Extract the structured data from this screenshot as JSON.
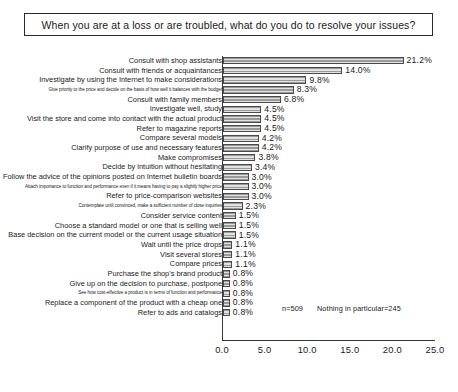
{
  "title": "When you are at a loss or are troubled, what do you do to resolve your issues?",
  "annotation": {
    "sample_size": "n=509",
    "nothing_in_particular": "Nothing in particular=245"
  },
  "chart_data": {
    "type": "bar",
    "orientation": "horizontal",
    "title": "When you are at a loss or are troubled, what do you do to resolve your issues?",
    "xlabel": "",
    "ylabel": "",
    "xlim": [
      0.0,
      25.0
    ],
    "xticks": [
      "0.0",
      "5.0",
      "10.0",
      "15.0",
      "20.0",
      "25.0"
    ],
    "xtick_values": [
      0.0,
      5.0,
      10.0,
      15.0,
      20.0,
      25.0
    ],
    "unit": "%",
    "grid": false,
    "legend": null,
    "categories": [
      "Consult with shop assistants",
      "Consult with friends or acquaintances",
      "Investigate by using the Internet to make considerations",
      "Give priority to the price and decide on the basis of how well it balances with the budget",
      "Consult with family members",
      "Investigate well, study",
      "Visit the store and come into contact with the actual product",
      "Refer to magazine reports",
      "Compare several models",
      "Clarify purpose of use and necessary features",
      "Make compromises",
      "Decide by intuition without hesitating",
      "Follow the advice of the opinions posted on Internet bulletin boards",
      "Attach importance to function and performance even if it means having to pay a slightly higher price",
      "Refer to price-comparison websites",
      "Contemplate until convinced, make a sufficient number of close inquiries",
      "Consider service content",
      "Choose a standard model or one that is selling well",
      "Base decision on the current model or the current usage situation",
      "Wait until the price drops",
      "Visit several stores",
      "Compare prices",
      "Purchase the shop's brand product",
      "Give up on the decision to purchase, postpone",
      "See how cost-effective a product is in terms of function and performance",
      "Replace a component of the product with a cheap one",
      "Refer to ads and catalogs"
    ],
    "values": [
      21.2,
      14.0,
      9.8,
      8.3,
      6.8,
      4.5,
      4.5,
      4.5,
      4.2,
      4.2,
      3.8,
      3.4,
      3.0,
      3.0,
      3.0,
      2.3,
      1.5,
      1.5,
      1.5,
      1.1,
      1.1,
      1.1,
      0.8,
      0.8,
      0.8,
      0.8,
      0.8
    ],
    "value_labels": [
      "21.2%",
      "14.0%",
      "9.8%",
      "8.3%",
      "6.8%",
      "4.5%",
      "4.5%",
      "4.5%",
      "4.2%",
      "4.2%",
      "3.8%",
      "3.4%",
      "3.0%",
      "3.0%",
      "3.0%",
      "2.3%",
      "1.5%",
      "1.5%",
      "1.5%",
      "1.1%",
      "1.1%",
      "1.1%",
      "0.8%",
      "0.8%",
      "0.8%",
      "0.8%",
      "0.8%"
    ],
    "label_sizes": [
      "normal",
      "normal",
      "normal",
      "tiny",
      "normal",
      "normal",
      "normal",
      "normal",
      "normal",
      "normal",
      "normal",
      "normal",
      "normal",
      "tiny",
      "normal",
      "tiny",
      "normal",
      "normal",
      "normal",
      "normal",
      "normal",
      "normal",
      "normal",
      "normal",
      "tiny",
      "normal",
      "normal"
    ],
    "bar_color": "#d2d2d2",
    "bar_edge_color": "#4a4a4a"
  }
}
